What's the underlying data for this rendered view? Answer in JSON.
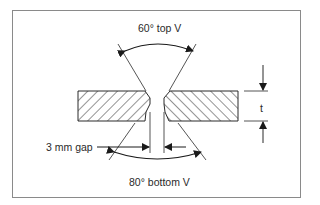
{
  "diagram": {
    "type": "weld joint preparation (double V butt joint)",
    "labels": {
      "top_angle": "60° top V",
      "bottom_angle": "80° bottom V",
      "gap": "3 mm gap",
      "thickness": "t"
    },
    "dimensions": {
      "top_v_angle_deg": 60,
      "bottom_v_angle_deg": 80,
      "root_gap_mm": 3,
      "plate_thickness_symbol": "t"
    },
    "components": [
      {
        "name": "left-plate",
        "fill": "hatched"
      },
      {
        "name": "right-plate",
        "fill": "hatched"
      }
    ],
    "colors": {
      "line": "#2a2a2a",
      "frame": "#8a8a8a",
      "background": "#ffffff"
    }
  }
}
